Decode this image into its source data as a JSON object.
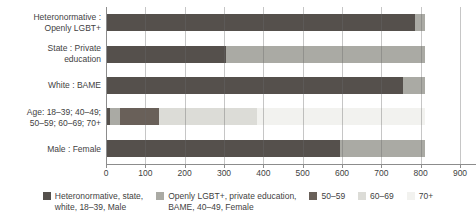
{
  "chart_data": {
    "type": "bar",
    "orientation": "horizontal-stacked",
    "title": "",
    "categories": [
      "Heteronormative :\nOpenly LGBT+",
      "State : Private\neducation",
      "White : BAME",
      "Age: 18–39; 40–49;\n50–59; 60–69; 70+",
      "Male : Female"
    ],
    "series": [
      {
        "name": "Heteronormative, state,\nwhite, 18–39, Male",
        "color": "#55504c",
        "values": [
          785,
          305,
          755,
          10,
          595
        ]
      },
      {
        "name": "Openly LGBT+, private education,\nBAME, 40–49, Female",
        "color": "#aaaaa4",
        "values": [
          25,
          505,
          55,
          25,
          215
        ]
      },
      {
        "name": "50–59",
        "color": "#696059",
        "values": [
          0,
          0,
          0,
          100,
          0
        ]
      },
      {
        "name": "60–69",
        "color": "#dcdcd7",
        "values": [
          0,
          0,
          0,
          250,
          0
        ]
      },
      {
        "name": "70+",
        "color": "#f2f2ef",
        "values": [
          0,
          0,
          0,
          425,
          0
        ]
      }
    ],
    "xlim": [
      0,
      900
    ],
    "xticks": [
      "0",
      "100",
      "200",
      "300",
      "400",
      "500",
      "600",
      "700",
      "800",
      "900"
    ],
    "grid": "vertical",
    "legend_position": "bottom"
  },
  "colors": {
    "background": "#ffffff",
    "text": "#3f3f3f",
    "axis": "#8c8c8c",
    "gridline": "#a3a3a3"
  }
}
